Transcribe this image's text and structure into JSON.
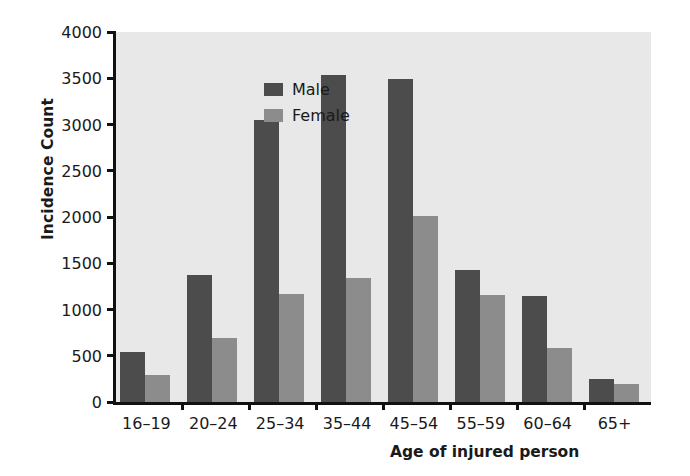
{
  "chart_data": {
    "type": "bar",
    "title": "",
    "xlabel": "Age of injured person",
    "ylabel": "Incidence Count",
    "categories": [
      "16–19",
      "20–24",
      "25–34",
      "35–44",
      "45–54",
      "55–59",
      "60–64",
      "65+"
    ],
    "series": [
      {
        "name": "Male",
        "color": "#4c4c4c",
        "values": [
          540,
          1370,
          3050,
          3540,
          3490,
          1430,
          1150,
          250
        ]
      },
      {
        "name": "Female",
        "color": "#8c8c8c",
        "values": [
          290,
          690,
          1170,
          1340,
          2010,
          1160,
          580,
          200
        ]
      }
    ],
    "ylim": [
      0,
      4000
    ],
    "yticks": [
      0,
      500,
      1000,
      1500,
      2000,
      2500,
      3000,
      3500,
      4000
    ],
    "ytick_labels": [
      "0",
      "500",
      "1000",
      "1500",
      "2000",
      "2500",
      "3000",
      "3500",
      "4000"
    ],
    "grid": false,
    "legend_position": "top-left",
    "plot_background": "#e8e8e8",
    "axis_color": "#111111"
  },
  "legend": {
    "items": [
      {
        "label": "Male",
        "color": "#4c4c4c"
      },
      {
        "label": "Female",
        "color": "#8c8c8c"
      }
    ]
  },
  "axes": {
    "y_title": "Incidence Count",
    "x_title": "Age of injured person"
  }
}
